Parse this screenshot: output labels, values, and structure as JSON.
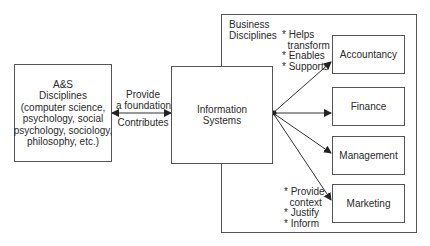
{
  "diagram": {
    "left_box": {
      "title": "A&S\nDisciplines\n(computer science,\npsychology, social\npsychology, sociology,\nphilosophy, etc.)"
    },
    "link_left": {
      "top_label": "Provide\na foundation",
      "bottom_label": "Contributes"
    },
    "center_box": {
      "title": "Information\nSystems"
    },
    "business_group": {
      "title": "Business\nDisciplines",
      "top_annotations": "* Helps\n  transform\n* Enables\n* Supports",
      "bottom_annotations": "* Provide\n  context\n* Justify\n* Inform",
      "items": [
        {
          "label": "Accountancy"
        },
        {
          "label": "Finance"
        },
        {
          "label": "Management"
        },
        {
          "label": "Marketing"
        }
      ]
    },
    "colors": {
      "line": "#333333",
      "border": "#555555",
      "text": "#2a2a2a"
    }
  }
}
